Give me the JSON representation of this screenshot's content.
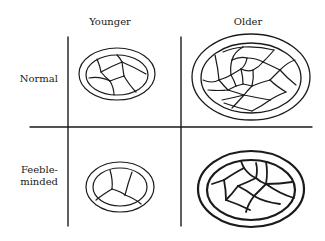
{
  "diagram": {
    "columns": [
      {
        "label": "Younger"
      },
      {
        "label": "Older"
      }
    ],
    "rows": [
      {
        "label": "Normal"
      },
      {
        "label_line1": "Feeble-",
        "label_line2": "minded"
      }
    ],
    "cells": [
      {
        "row": "Normal",
        "column": "Younger",
        "description": "small double-ringed oval, few cells"
      },
      {
        "row": "Normal",
        "column": "Older",
        "description": "large double-ringed oval, many cells"
      },
      {
        "row": "Feeble-minded",
        "column": "Younger",
        "description": "small double-ringed oval, three sections"
      },
      {
        "row": "Feeble-minded",
        "column": "Older",
        "description": "large bold double-ringed oval, few cells"
      }
    ],
    "colors": {
      "ink": "#1a1a1a",
      "background": "#ffffff"
    }
  }
}
